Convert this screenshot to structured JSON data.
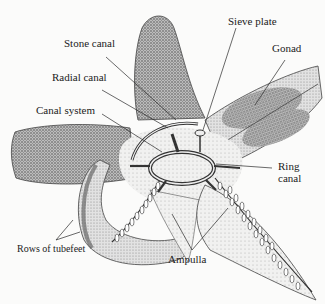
{
  "diagram": {
    "labels": {
      "sieve_plate": "Sieve plate",
      "stone_canal": "Stone canal",
      "gonad": "Gonad",
      "radial_canal": "Radial canal",
      "canal_system": "Canal system",
      "ring_canal_line1": "Ring",
      "ring_canal_line2": "canal",
      "rows_of_tubefeet": "Rows of tubefeet",
      "ampulla": "Ampulla"
    },
    "colors": {
      "background": "#fbfbfa",
      "stipple_dark": "#6b6b6b",
      "stipple_mid": "#a8a8a8",
      "stipple_light": "#d9d9d9",
      "line": "#2a2a2a"
    }
  }
}
